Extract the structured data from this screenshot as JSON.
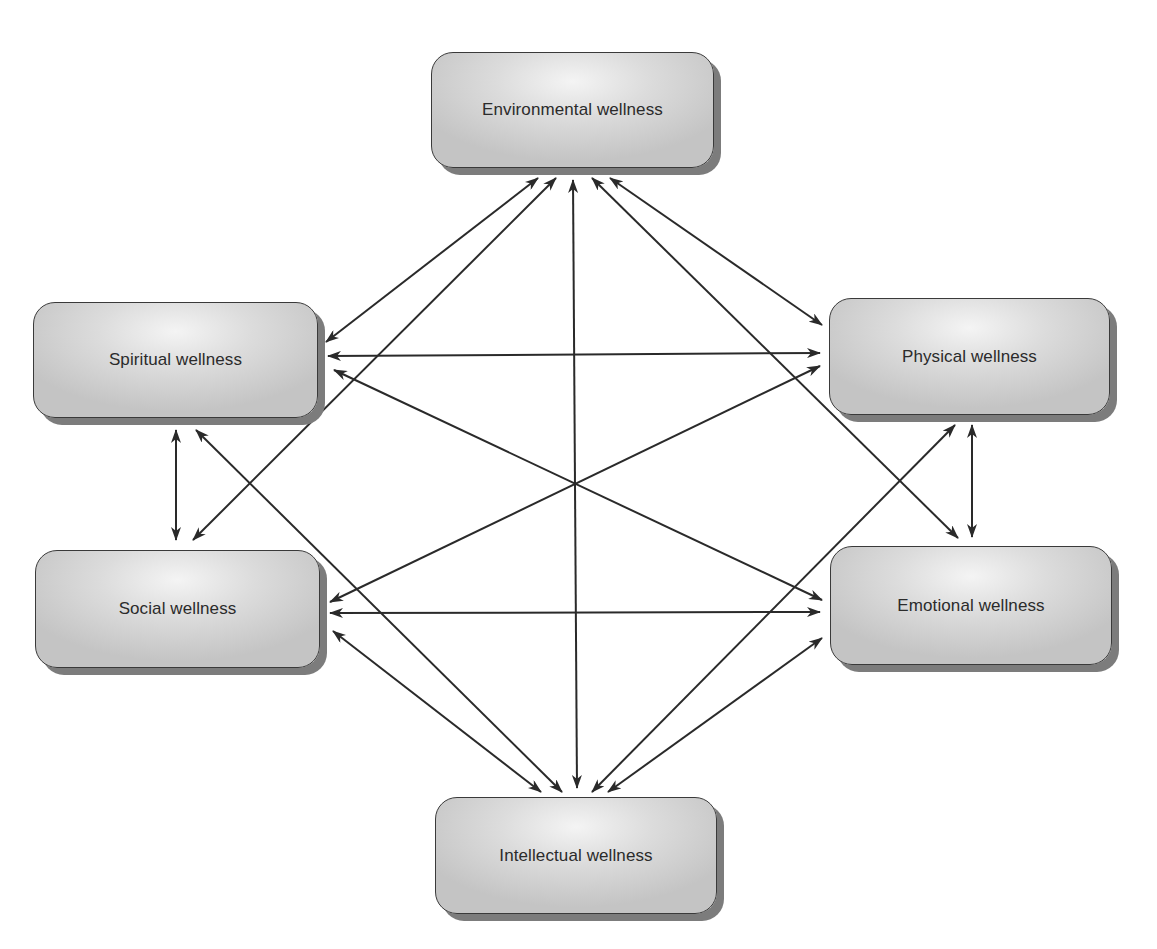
{
  "diagram": {
    "title": "",
    "nodes": [
      {
        "id": "environmental",
        "label": "Environmental wellness",
        "x": 431,
        "y": 52,
        "w": 283,
        "h": 116
      },
      {
        "id": "spiritual",
        "label": "Spiritual wellness",
        "x": 33,
        "y": 302,
        "w": 285,
        "h": 116
      },
      {
        "id": "physical",
        "label": "Physical wellness",
        "x": 829,
        "y": 298,
        "w": 281,
        "h": 117
      },
      {
        "id": "social",
        "label": "Social wellness",
        "x": 35,
        "y": 550,
        "w": 285,
        "h": 118
      },
      {
        "id": "emotional",
        "label": "Emotional wellness",
        "x": 830,
        "y": 546,
        "w": 282,
        "h": 119
      },
      {
        "id": "intellectual",
        "label": "Intellectual wellness",
        "x": 435,
        "y": 797,
        "w": 282,
        "h": 117
      }
    ],
    "edges": [
      {
        "from": "environmental",
        "to": "spiritual",
        "bidirectional": true,
        "x1": 538,
        "y1": 178,
        "x2": 326,
        "y2": 342
      },
      {
        "from": "environmental",
        "to": "social",
        "bidirectional": true,
        "x1": 556,
        "y1": 178,
        "x2": 193,
        "y2": 540
      },
      {
        "from": "environmental",
        "to": "intellectual",
        "bidirectional": true,
        "x1": 573,
        "y1": 180,
        "x2": 577,
        "y2": 788
      },
      {
        "from": "environmental",
        "to": "emotional",
        "bidirectional": true,
        "x1": 592,
        "y1": 178,
        "x2": 958,
        "y2": 538
      },
      {
        "from": "environmental",
        "to": "physical",
        "bidirectional": true,
        "x1": 610,
        "y1": 178,
        "x2": 822,
        "y2": 325
      },
      {
        "from": "spiritual",
        "to": "physical",
        "bidirectional": true,
        "x1": 328,
        "y1": 356,
        "x2": 820,
        "y2": 353
      },
      {
        "from": "spiritual",
        "to": "emotional",
        "bidirectional": true,
        "x1": 334,
        "y1": 370,
        "x2": 822,
        "y2": 600
      },
      {
        "from": "spiritual",
        "to": "social",
        "bidirectional": true,
        "x1": 176,
        "y1": 430,
        "x2": 176,
        "y2": 540
      },
      {
        "from": "spiritual",
        "to": "intellectual",
        "bidirectional": true,
        "x1": 196,
        "y1": 430,
        "x2": 562,
        "y2": 792
      },
      {
        "from": "social",
        "to": "physical",
        "bidirectional": true,
        "x1": 330,
        "y1": 602,
        "x2": 820,
        "y2": 366
      },
      {
        "from": "social",
        "to": "emotional",
        "bidirectional": true,
        "x1": 330,
        "y1": 613,
        "x2": 820,
        "y2": 612
      },
      {
        "from": "social",
        "to": "intellectual",
        "bidirectional": true,
        "x1": 333,
        "y1": 631,
        "x2": 541,
        "y2": 792
      },
      {
        "from": "physical",
        "to": "emotional",
        "bidirectional": true,
        "x1": 972,
        "y1": 425,
        "x2": 972,
        "y2": 537
      },
      {
        "from": "physical",
        "to": "intellectual",
        "bidirectional": true,
        "x1": 955,
        "y1": 425,
        "x2": 592,
        "y2": 792
      },
      {
        "from": "emotional",
        "to": "intellectual",
        "bidirectional": true,
        "x1": 822,
        "y1": 638,
        "x2": 608,
        "y2": 792
      }
    ]
  },
  "colors": {
    "edge": "#2a2a2a",
    "node_border": "#3a3a3a",
    "node_shadow": "#7c7c7c",
    "text": "#2b2b2b"
  }
}
